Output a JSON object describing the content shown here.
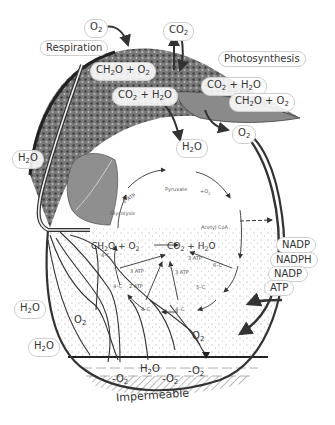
{
  "labels": {
    "respiration": "Respiration",
    "photosynthesis": "Photosynthesis",
    "o2_top": "O2",
    "co2_top": "CO2",
    "resp_sugar": "CH2O + O2",
    "resp_products": "CO2 + H2O",
    "photo_inputs": "CO2 + H2O",
    "photo_outputs": "CH2O + O2",
    "o2_right": "O2",
    "h2o_mid": "H2O",
    "h2o_trunk": "H2O",
    "nadp1": "NADP",
    "nadph": "NADPH",
    "nadp2": "NADP",
    "atp": "ATP",
    "h2o_left1": "H2O",
    "h2o_left2": "H2O",
    "o2_soil_left": "O2",
    "o2_soil_right": "O2",
    "h2o_water": "H2O",
    "minus_o2_a": "-O2",
    "minus_o2_b": "-O2",
    "minus_o2_c": "-O2",
    "impermeable": "Impermeable"
  },
  "cycle": {
    "glycolysis": "Glycolysis",
    "pyruvate": "Pyruvate",
    "atp_2_top": "2 ATP",
    "plus_o2": "+O2",
    "acetyl_coa": "Acetyl CoA",
    "sugar": "CH2O + O2",
    "products": "CO2 + H2O",
    "c4_a": "4–C",
    "c6": "6–C",
    "c5": "5–C",
    "c4_b": "4–C",
    "c4_c": "4–C",
    "c4_d": "4–C",
    "atp_3_a": "3 ATP",
    "atp_3_b": "3 ATP",
    "atp_3_c": "3 ATP",
    "atp_2_bottom": "2 ATP"
  },
  "colors": {
    "ink": "#333333",
    "leaf_dark": "#3a3a3a",
    "leaf_mid": "#7a7a7a",
    "soil_dots": "#9a9a9a",
    "water_line": "#222222",
    "hatch": "#8a8a8a"
  }
}
